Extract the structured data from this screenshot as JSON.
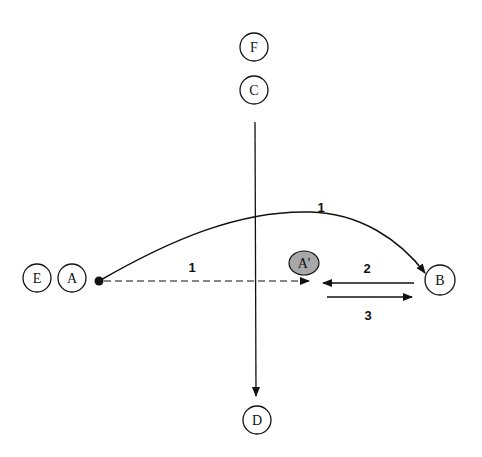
{
  "diagram": {
    "nodes": {
      "F": {
        "label": "F"
      },
      "C": {
        "label": "C"
      },
      "D": {
        "label": "D"
      },
      "E": {
        "label": "E"
      },
      "A": {
        "label": "A"
      },
      "A_prime": {
        "label": "A'",
        "fill": "#a8a8a8"
      },
      "B": {
        "label": "B"
      }
    },
    "edges": {
      "curve_A_to_B": {
        "label": "1",
        "style": "solid",
        "direction": "A to B"
      },
      "dashed_A_to_A_prime": {
        "label": "1",
        "style": "dashed",
        "direction": "A to A'"
      },
      "arrow_B_to_A_prime": {
        "label": "2",
        "style": "solid",
        "direction": "B to A'"
      },
      "arrow_A_prime_to_B": {
        "label": "3",
        "style": "solid",
        "direction": "A' to B"
      },
      "vertical_C_to_D": {
        "label": "",
        "style": "solid",
        "direction": "C to D"
      }
    }
  }
}
